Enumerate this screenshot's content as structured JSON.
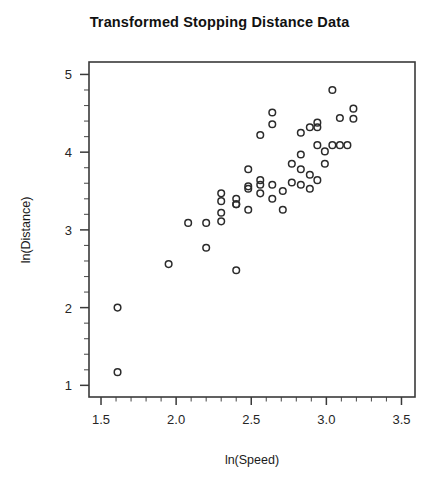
{
  "chart_data": {
    "type": "scatter",
    "title": "Transformed Stopping Distance Data",
    "xlabel": "ln(Speed)",
    "ylabel": "ln(Distance)",
    "xlim": [
      1.42,
      3.59
    ],
    "ylim": [
      0.85,
      5.16
    ],
    "grid": false,
    "legend": null,
    "x_major_ticks": [
      1.5,
      2.0,
      2.5,
      3.0,
      3.5
    ],
    "x_major_tick_labels": [
      "1.5",
      "2.0",
      "2.5",
      "3.0",
      "3.5"
    ],
    "x_minor_ticks": [
      1.6,
      1.7,
      1.8,
      1.9,
      2.1,
      2.2,
      2.3,
      2.4,
      2.6,
      2.7,
      2.8,
      2.9,
      3.1,
      3.2,
      3.3,
      3.4
    ],
    "y_major_ticks": [
      1,
      2,
      3,
      4,
      5
    ],
    "y_major_tick_labels": [
      "1",
      "2",
      "3",
      "4",
      "5"
    ],
    "y_minor_ticks": [
      1.2,
      1.4,
      1.6,
      1.8,
      2.2,
      2.4,
      2.6,
      2.8,
      3.2,
      3.4,
      3.6,
      3.8,
      4.2,
      4.4,
      4.6,
      4.8
    ],
    "marker": "open-circle",
    "marker_color": "#2b2b2b",
    "n_points": 50,
    "points": [
      [
        1.61,
        1.17
      ],
      [
        1.61,
        2.0
      ],
      [
        1.95,
        2.56
      ],
      [
        2.08,
        3.09
      ],
      [
        2.2,
        3.09
      ],
      [
        2.2,
        2.77
      ],
      [
        2.3,
        3.22
      ],
      [
        2.3,
        3.11
      ],
      [
        2.3,
        3.37
      ],
      [
        2.3,
        3.47
      ],
      [
        2.4,
        2.48
      ],
      [
        2.4,
        3.33
      ],
      [
        2.4,
        3.33
      ],
      [
        2.4,
        3.4
      ],
      [
        2.48,
        3.26
      ],
      [
        2.48,
        3.53
      ],
      [
        2.48,
        3.56
      ],
      [
        2.48,
        3.78
      ],
      [
        2.56,
        3.47
      ],
      [
        2.56,
        3.58
      ],
      [
        2.56,
        3.64
      ],
      [
        2.56,
        4.22
      ],
      [
        2.64,
        3.4
      ],
      [
        2.64,
        3.58
      ],
      [
        2.64,
        4.36
      ],
      [
        2.64,
        4.51
      ],
      [
        2.71,
        3.26
      ],
      [
        2.71,
        3.5
      ],
      [
        2.77,
        3.61
      ],
      [
        2.77,
        3.85
      ],
      [
        2.83,
        3.58
      ],
      [
        2.83,
        3.78
      ],
      [
        2.83,
        3.97
      ],
      [
        2.83,
        4.25
      ],
      [
        2.89,
        3.53
      ],
      [
        2.89,
        3.71
      ],
      [
        2.89,
        4.32
      ],
      [
        2.94,
        3.64
      ],
      [
        2.94,
        4.09
      ],
      [
        2.94,
        4.32
      ],
      [
        2.94,
        4.38
      ],
      [
        2.99,
        3.85
      ],
      [
        2.99,
        4.01
      ],
      [
        3.04,
        4.09
      ],
      [
        3.04,
        4.8
      ],
      [
        3.09,
        4.09
      ],
      [
        3.09,
        4.44
      ],
      [
        3.14,
        4.09
      ],
      [
        3.18,
        4.43
      ],
      [
        3.18,
        4.56
      ]
    ]
  },
  "axes": {
    "plot_area_px": {
      "left": 89,
      "top": 62,
      "right": 415,
      "bottom": 397
    }
  }
}
